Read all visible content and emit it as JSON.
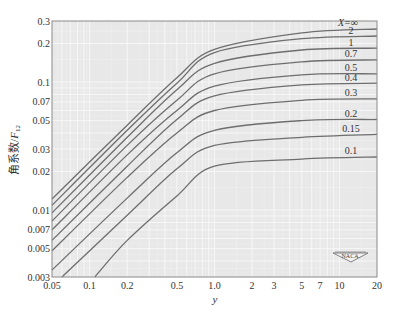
{
  "chart_data": {
    "type": "line",
    "title": "",
    "xlabel": "y",
    "ylabel": "角系数/F12",
    "ylabel_main": "角系数/",
    "ylabel_var": "F",
    "ylabel_sub": "12",
    "xscale": "log",
    "yscale": "log",
    "xlim": [
      0.05,
      20
    ],
    "ylim": [
      0.003,
      0.3
    ],
    "grid": true,
    "x_ticks": [
      0.05,
      0.1,
      0.2,
      0.5,
      1.0,
      2,
      3,
      5,
      7,
      10,
      20
    ],
    "x_tick_labels": [
      "0.05",
      "0.1",
      "0.2",
      "0.5",
      "1.0",
      "2",
      "3",
      "5",
      "7",
      "10",
      "20"
    ],
    "y_ticks": [
      0.003,
      0.005,
      0.007,
      0.01,
      0.02,
      0.03,
      0.05,
      0.07,
      0.1,
      0.2,
      0.3
    ],
    "y_tick_labels": [
      "0.003",
      "0.005",
      "0.007",
      "0.01",
      "0.02",
      "0.03",
      "0.05",
      "0.07",
      "0.1",
      "0.2",
      "0.3"
    ],
    "legend_title": "X=∞",
    "x": [
      0.05,
      0.2,
      0.5,
      1.0,
      5,
      20
    ],
    "series": [
      {
        "name": "X=∞",
        "label": "X=∞",
        "values": [
          0.0122,
          0.046,
          0.108,
          0.18,
          0.242,
          0.26
        ]
      },
      {
        "name": "X=2",
        "label": "2",
        "values": [
          0.0109,
          0.042,
          0.098,
          0.17,
          0.218,
          0.229
        ]
      },
      {
        "name": "X=1",
        "label": "1",
        "values": [
          0.0095,
          0.037,
          0.087,
          0.14,
          0.178,
          0.184
        ]
      },
      {
        "name": "X=0.7",
        "label": "0.7",
        "values": [
          0.0082,
          0.032,
          0.072,
          0.116,
          0.144,
          0.149
        ]
      },
      {
        "name": "X=0.5",
        "label": "0.5",
        "values": [
          0.007,
          0.027,
          0.06,
          0.093,
          0.114,
          0.116
        ]
      },
      {
        "name": "X=0.4",
        "label": "0.4",
        "values": [
          0.0058,
          0.022,
          0.051,
          0.078,
          0.095,
          0.098
        ]
      },
      {
        "name": "X=0.3",
        "label": "0.3",
        "values": [
          0.0048,
          0.018,
          0.04,
          0.06,
          0.072,
          0.074
        ]
      },
      {
        "name": "X=0.2",
        "label": "0.2",
        "values": [
          0.0034,
          0.0124,
          0.028,
          0.042,
          0.05,
          0.051
        ]
      },
      {
        "name": "X=0.15",
        "label": "0.15",
        "values": [
          null,
          0.0091,
          0.021,
          0.032,
          0.037,
          0.039
        ],
        "start": [
          0.06,
          0.003
        ]
      },
      {
        "name": "X=0.1",
        "label": "0.1",
        "values": [
          null,
          0.0058,
          0.0129,
          0.022,
          0.025,
          0.026
        ],
        "start": [
          0.11,
          0.003
        ]
      }
    ],
    "annotations": [
      "NACA"
    ]
  },
  "colors": {
    "background": "#ffffff",
    "plot_bg": "#e8e8e8",
    "grid": "#f7f7f7",
    "curve": "#6e6e6e",
    "frame": "#8a8a8a",
    "text": "#333333"
  },
  "badge": {
    "label": "NACA"
  }
}
